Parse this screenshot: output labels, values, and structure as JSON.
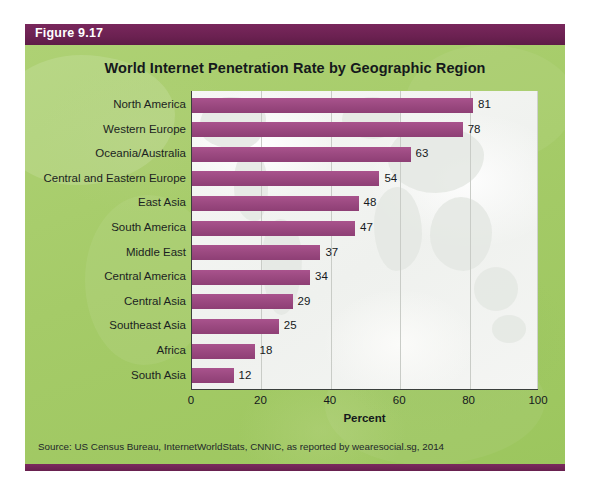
{
  "figure": {
    "label": "Figure 9.17",
    "title": "World Internet Penetration Rate by Geographic Region",
    "source": "Source: US Census Bureau, InternetWorldStats, CNNIC, as reported by wearesocial.sg, 2014"
  },
  "colors": {
    "figure_label_bar": "#6E2253",
    "panel_green": "#A6CC6A",
    "bar_purple": "#9C4A81",
    "plot_background": "#F3F4F2",
    "axis": "#3a3f3c",
    "gridline": "#C9CCC7"
  },
  "chart_data": {
    "type": "bar",
    "orientation": "horizontal",
    "title": "World Internet Penetration Rate by Geographic Region",
    "xlabel": "Percent",
    "ylabel": "",
    "xlim": [
      0,
      100
    ],
    "xticks": [
      0,
      20,
      40,
      60,
      80,
      100
    ],
    "xtick_labels": [
      "0",
      "20",
      "40",
      "60",
      "80",
      "100"
    ],
    "grid": true,
    "grid_axis": "x",
    "legend": false,
    "series_color": "#9C4A81",
    "value_labels": true,
    "categories": [
      "North America",
      "Western Europe",
      "Oceania/Australia",
      "Central and Eastern Europe",
      "East Asia",
      "South America",
      "Middle East",
      "Central America",
      "Central Asia",
      "Southeast Asia",
      "Africa",
      "South Asia"
    ],
    "values": [
      81,
      78,
      63,
      54,
      48,
      47,
      37,
      34,
      29,
      25,
      18,
      12
    ],
    "value_label_texts": [
      "81",
      "78",
      "63",
      "54",
      "48",
      "47",
      "37",
      "34",
      "29",
      "25",
      "18",
      "12"
    ]
  }
}
